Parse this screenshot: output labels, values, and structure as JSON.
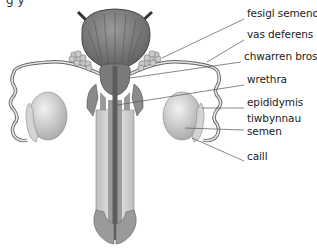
{
  "figure": {
    "caption_fragment": "g               y",
    "labels": [
      {
        "id": "seminal-vesicle",
        "text": "fesigl semenol",
        "x": 247,
        "y": 13
      },
      {
        "id": "vas-deferens",
        "text": "vas deferens",
        "x": 247,
        "y": 34
      },
      {
        "id": "prostate",
        "text": "chwarren brostad",
        "x": 244,
        "y": 56
      },
      {
        "id": "urethra",
        "text": "wrethra",
        "x": 247,
        "y": 79
      },
      {
        "id": "epididymis",
        "text": "epididymis",
        "x": 247,
        "y": 102
      },
      {
        "id": "seminiferous-tubules-1",
        "text": "tiwbynnau",
        "x": 247,
        "y": 118
      },
      {
        "id": "seminiferous-tubules-2",
        "text": "semen",
        "x": 247,
        "y": 131
      },
      {
        "id": "scrotum",
        "text": "caill",
        "x": 247,
        "y": 156
      }
    ]
  },
  "colors": {
    "bladder": "#7c7c7c",
    "bladder_dark": "#5a5a5a",
    "tissue_mid": "#8e8e8e",
    "tissue_light": "#d8d8d8",
    "testis": "#cfcfcf",
    "line": "#555555",
    "text": "#222222"
  }
}
